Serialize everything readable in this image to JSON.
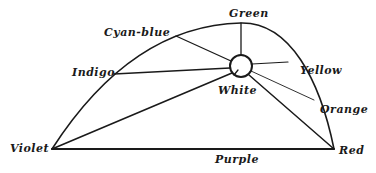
{
  "diagram": {
    "type": "color-triangle-curve",
    "labels": {
      "green": "Green",
      "cyan_blue": "Cyan-blue",
      "indigo": "Indigo",
      "yellow": "Yellow",
      "white": "White",
      "orange": "Orange",
      "violet": "Violet",
      "purple": "Purple",
      "red": "Red"
    },
    "colors": {
      "line": "#1a1a1a",
      "background": "#ffffff"
    }
  }
}
